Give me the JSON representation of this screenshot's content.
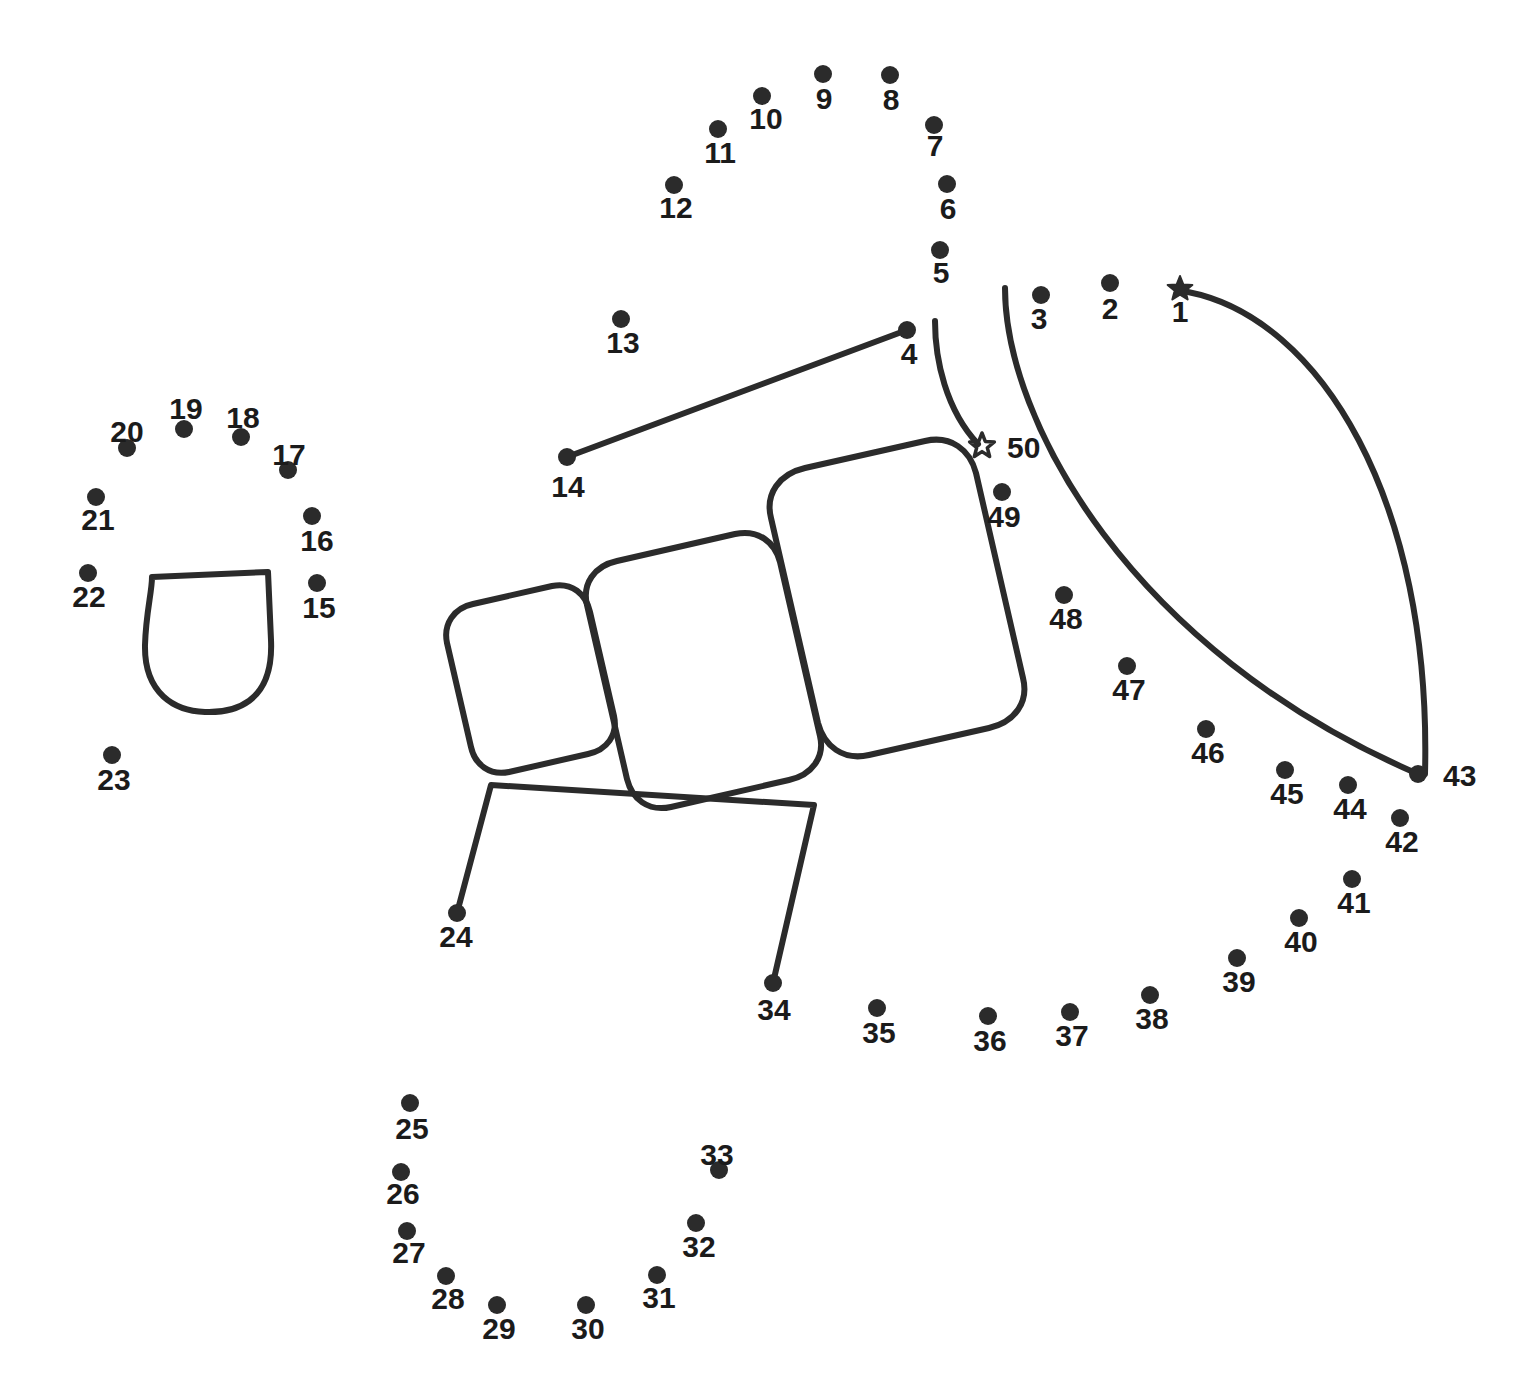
{
  "page": {
    "background_color": "#ffffff",
    "ink_color": "#2b2b2b",
    "width": 1522,
    "height": 1389
  },
  "puzzle": {
    "type": "connect-the-dots",
    "dot_count": 50,
    "start_marker": "filled-star",
    "end_marker": "outline-star",
    "dot_radius": 9,
    "label_font_size": 30,
    "dots": [
      {
        "n": "1",
        "x": 1180,
        "y": 289,
        "marker": "filled-star",
        "lx": 1180,
        "ly": 314
      },
      {
        "n": "2",
        "x": 1110,
        "y": 283,
        "marker": "dot",
        "lx": 1110,
        "ly": 311
      },
      {
        "n": "3",
        "x": 1041,
        "y": 295,
        "marker": "dot",
        "lx": 1039,
        "ly": 321
      },
      {
        "n": "4",
        "x": 907,
        "y": 330,
        "marker": "dot",
        "lx": 909,
        "ly": 356
      },
      {
        "n": "5",
        "x": 940,
        "y": 250,
        "marker": "dot",
        "lx": 941,
        "ly": 275
      },
      {
        "n": "6",
        "x": 947,
        "y": 184,
        "marker": "dot",
        "lx": 948,
        "ly": 211
      },
      {
        "n": "7",
        "x": 934,
        "y": 125,
        "marker": "dot",
        "lx": 935,
        "ly": 148
      },
      {
        "n": "8",
        "x": 890,
        "y": 75,
        "marker": "dot",
        "lx": 891,
        "ly": 102
      },
      {
        "n": "9",
        "x": 823,
        "y": 74,
        "marker": "dot",
        "lx": 824,
        "ly": 101
      },
      {
        "n": "10",
        "x": 762,
        "y": 96,
        "marker": "dot",
        "lx": 766,
        "ly": 121
      },
      {
        "n": "11",
        "x": 718,
        "y": 129,
        "marker": "dot",
        "lx": 720,
        "ly": 155
      },
      {
        "n": "12",
        "x": 674,
        "y": 185,
        "marker": "dot",
        "lx": 676,
        "ly": 210
      },
      {
        "n": "13",
        "x": 621,
        "y": 319,
        "marker": "dot",
        "lx": 623,
        "ly": 345
      },
      {
        "n": "14",
        "x": 567,
        "y": 457,
        "marker": "dot",
        "lx": 568,
        "ly": 489
      },
      {
        "n": "15",
        "x": 317,
        "y": 583,
        "marker": "dot",
        "lx": 319,
        "ly": 610
      },
      {
        "n": "16",
        "x": 312,
        "y": 516,
        "marker": "dot",
        "lx": 317,
        "ly": 543
      },
      {
        "n": "17",
        "x": 288,
        "y": 470,
        "marker": "dot",
        "lx": 289,
        "ly": 457
      },
      {
        "n": "18",
        "x": 241,
        "y": 437,
        "marker": "dot",
        "lx": 243,
        "ly": 420
      },
      {
        "n": "19",
        "x": 184,
        "y": 429,
        "marker": "dot",
        "lx": 186,
        "ly": 411
      },
      {
        "n": "20",
        "x": 127,
        "y": 448,
        "marker": "dot",
        "lx": 127,
        "ly": 434
      },
      {
        "n": "21",
        "x": 96,
        "y": 497,
        "marker": "dot",
        "lx": 98,
        "ly": 522
      },
      {
        "n": "22",
        "x": 88,
        "y": 573,
        "marker": "dot",
        "lx": 89,
        "ly": 599
      },
      {
        "n": "23",
        "x": 112,
        "y": 755,
        "marker": "dot",
        "lx": 114,
        "ly": 782
      },
      {
        "n": "24",
        "x": 457,
        "y": 913,
        "marker": "dot",
        "lx": 456,
        "ly": 939
      },
      {
        "n": "25",
        "x": 410,
        "y": 1103,
        "marker": "dot",
        "lx": 412,
        "ly": 1131
      },
      {
        "n": "26",
        "x": 401,
        "y": 1172,
        "marker": "dot",
        "lx": 403,
        "ly": 1196
      },
      {
        "n": "27",
        "x": 407,
        "y": 1231,
        "marker": "dot",
        "lx": 409,
        "ly": 1255
      },
      {
        "n": "28",
        "x": 446,
        "y": 1276,
        "marker": "dot",
        "lx": 448,
        "ly": 1301
      },
      {
        "n": "29",
        "x": 497,
        "y": 1305,
        "marker": "dot",
        "lx": 499,
        "ly": 1331
      },
      {
        "n": "30",
        "x": 586,
        "y": 1305,
        "marker": "dot",
        "lx": 588,
        "ly": 1331
      },
      {
        "n": "31",
        "x": 657,
        "y": 1275,
        "marker": "dot",
        "lx": 659,
        "ly": 1300
      },
      {
        "n": "32",
        "x": 696,
        "y": 1223,
        "marker": "dot",
        "lx": 699,
        "ly": 1249
      },
      {
        "n": "33",
        "x": 719,
        "y": 1170,
        "marker": "dot",
        "lx": 717,
        "ly": 1157
      },
      {
        "n": "34",
        "x": 773,
        "y": 983,
        "marker": "dot",
        "lx": 774,
        "ly": 1012
      },
      {
        "n": "35",
        "x": 877,
        "y": 1008,
        "marker": "dot",
        "lx": 879,
        "ly": 1035
      },
      {
        "n": "36",
        "x": 988,
        "y": 1016,
        "marker": "dot",
        "lx": 990,
        "ly": 1043
      },
      {
        "n": "37",
        "x": 1070,
        "y": 1012,
        "marker": "dot",
        "lx": 1072,
        "ly": 1038
      },
      {
        "n": "38",
        "x": 1150,
        "y": 995,
        "marker": "dot",
        "lx": 1152,
        "ly": 1021
      },
      {
        "n": "39",
        "x": 1237,
        "y": 958,
        "marker": "dot",
        "lx": 1239,
        "ly": 984
      },
      {
        "n": "40",
        "x": 1299,
        "y": 918,
        "marker": "dot",
        "lx": 1301,
        "ly": 944
      },
      {
        "n": "41",
        "x": 1352,
        "y": 879,
        "marker": "dot",
        "lx": 1354,
        "ly": 905
      },
      {
        "n": "42",
        "x": 1400,
        "y": 818,
        "marker": "dot",
        "lx": 1402,
        "ly": 844
      },
      {
        "n": "43",
        "x": 1418,
        "y": 774,
        "marker": "dot",
        "lx": 1443,
        "ly": 778
      },
      {
        "n": "44",
        "x": 1348,
        "y": 785,
        "marker": "dot",
        "lx": 1350,
        "ly": 811
      },
      {
        "n": "45",
        "x": 1285,
        "y": 770,
        "marker": "dot",
        "lx": 1287,
        "ly": 796
      },
      {
        "n": "46",
        "x": 1206,
        "y": 729,
        "marker": "dot",
        "lx": 1208,
        "ly": 755
      },
      {
        "n": "47",
        "x": 1127,
        "y": 666,
        "marker": "dot",
        "lx": 1129,
        "ly": 692
      },
      {
        "n": "48",
        "x": 1064,
        "y": 595,
        "marker": "dot",
        "lx": 1066,
        "ly": 621
      },
      {
        "n": "49",
        "x": 1002,
        "y": 492,
        "marker": "dot",
        "lx": 1004,
        "ly": 519
      },
      {
        "n": "50",
        "x": 982,
        "y": 446,
        "marker": "outline-star",
        "lx": 1007,
        "ly": 450
      }
    ],
    "drawn_shapes": [
      {
        "name": "bucket-outline",
        "kind": "path",
        "d": "M 152 577 L 268 572 L 271 640 C 274 705 232 713 205 712 C 175 711 144 694 145 645 C 146 612 152 592 152 577 Z"
      },
      {
        "name": "small-rounded-square",
        "kind": "path",
        "d": "M 473 604 L 552 586 C 572 582 586 594 590 612 L 614 716 C 618 735 607 750 588 754 L 509 772 C 490 776 475 765 471 747 L 447 643 C 443 624 454 608 473 604 Z"
      },
      {
        "name": "medium-rounded-square",
        "kind": "path",
        "d": "M 617 561 L 735 534 C 758 529 775 542 780 562 L 820 736 C 825 757 812 775 789 780 L 671 807 C 648 812 632 799 627 779 L 587 605 C 582 584 594 566 617 561 Z"
      },
      {
        "name": "large-rounded-square",
        "kind": "path",
        "d": "M 805 468 L 925 441 C 951 435 970 450 976 473 L 1023 678 C 1029 702 1015 722 989 728 L 869 755 C 843 761 824 746 818 723 L 771 518 C 765 494 779 474 805 468 Z"
      },
      {
        "name": "line-14-to-4",
        "kind": "path",
        "d": "M 567 457 L 907 330"
      },
      {
        "name": "open-trapezoid-24-to-34",
        "kind": "path",
        "d": "M 457 913 L 491 785 L 814 805 L 773 983"
      },
      {
        "name": "inner-curve-to-star-50",
        "kind": "path",
        "d": "M 935 321 C 935 360 946 410 978 444"
      },
      {
        "name": "outer-arc-3-to-43",
        "kind": "path",
        "d": "M 1005 288 C 1005 420 1130 650 1418 774"
      },
      {
        "name": "big-arc-1-to-43",
        "kind": "path",
        "d": "M 1188 292 C 1320 318 1432 500 1425 774"
      }
    ]
  }
}
